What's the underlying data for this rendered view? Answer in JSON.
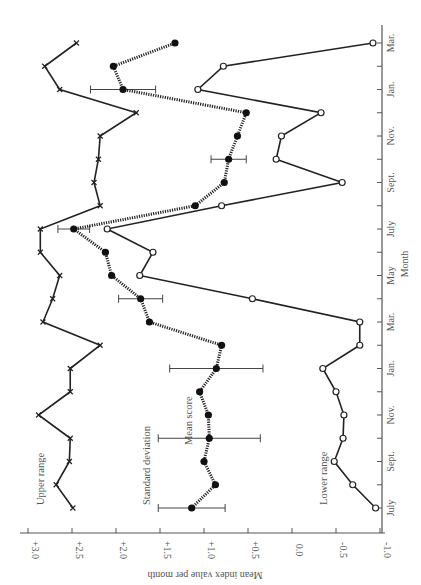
{
  "chart_data": {
    "type": "line",
    "orientation": "rotated-90-clockwise",
    "title": "",
    "xlabel": "Month",
    "ylabel": "Mean index value per month",
    "ylim": [
      -1.0,
      3.0
    ],
    "y_ticks": [
      "+3.0",
      "+2.5",
      "+2.0",
      "+1.5",
      "+1.0",
      "+0.5",
      "0.0",
      "-0.5",
      "-1.0"
    ],
    "y_tick_values": [
      3.0,
      2.5,
      2.0,
      1.5,
      1.0,
      0.5,
      0.0,
      -0.5,
      -1.0
    ],
    "x_tick_labels": [
      "July",
      "Sept.",
      "Nov.",
      "Jan.",
      "Mar.",
      "May",
      "July",
      "Sept.",
      "Nov.",
      "Jan.",
      "Mar."
    ],
    "x_tick_indices": [
      0,
      2,
      4,
      6,
      8,
      10,
      12,
      14,
      16,
      18,
      20
    ],
    "months": [
      "Jul",
      "Aug",
      "Sep",
      "Oct",
      "Nov",
      "Dec",
      "Jan",
      "Feb",
      "Mar",
      "Apr",
      "May",
      "Jun",
      "Jul",
      "Aug",
      "Sep",
      "Oct",
      "Nov",
      "Dec",
      "Jan",
      "Feb",
      "Mar"
    ],
    "grid": false,
    "series": [
      {
        "name": "Upper range",
        "marker": "x",
        "line": "solid",
        "values": [
          2.49,
          2.68,
          2.53,
          2.52,
          2.88,
          2.52,
          2.52,
          2.18,
          2.83,
          2.72,
          2.64,
          2.86,
          2.86,
          2.18,
          2.25,
          2.2,
          2.18,
          1.77,
          2.64,
          2.81,
          2.45
        ]
      },
      {
        "name": "Mean score",
        "marker": "filled-circle",
        "line": "dotted",
        "values": [
          1.14,
          0.87,
          1.0,
          0.94,
          0.95,
          1.05,
          0.86,
          0.8,
          1.62,
          1.72,
          2.05,
          2.12,
          2.48,
          1.1,
          0.77,
          0.72,
          0.62,
          0.52,
          1.92,
          2.03,
          1.33
        ]
      },
      {
        "name": "Lower range",
        "marker": "open-circle",
        "line": "solid",
        "values": [
          -0.95,
          -0.69,
          -0.48,
          -0.58,
          -0.59,
          -0.5,
          -0.35,
          -0.77,
          -0.77,
          0.45,
          1.73,
          1.58,
          2.1,
          0.8,
          -0.57,
          0.18,
          0.12,
          -0.33,
          1.07,
          0.78,
          -0.92
        ]
      }
    ],
    "error_bars": {
      "name": "Standard deviation",
      "indices": [
        0,
        3,
        6,
        9,
        12,
        15,
        18
      ],
      "half_width": [
        0.38,
        0.58,
        0.53,
        0.25,
        0.18,
        0.2,
        0.37
      ]
    },
    "annotations": [
      "Upper range",
      "Standard deviation",
      "Mean score",
      "Lower range"
    ]
  },
  "labels": {
    "upper": "Upper range",
    "sd": "Standard deviation",
    "mean": "Mean score",
    "lower": "Lower range",
    "ylabel": "Mean index value per month",
    "xlabel": "Month"
  }
}
